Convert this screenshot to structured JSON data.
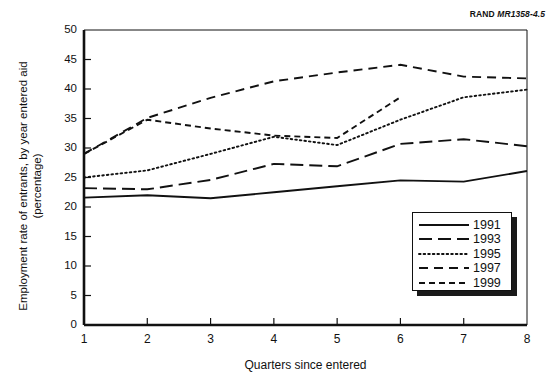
{
  "figure": {
    "source_note_brand": "RAND",
    "source_note_code": "MR1358-4.5"
  },
  "chart_data": {
    "type": "line",
    "title": "",
    "xlabel": "Quarters since entered",
    "ylabel": "Employment rate of entrants, by year entered aid\n(percentage)",
    "x": [
      1,
      2,
      3,
      4,
      5,
      6,
      7,
      8
    ],
    "categories": [
      "1",
      "2",
      "3",
      "4",
      "5",
      "6",
      "7",
      "8"
    ],
    "xlim": [
      1,
      8
    ],
    "ylim": [
      0,
      50
    ],
    "yticks": [
      0,
      5,
      10,
      15,
      20,
      25,
      30,
      35,
      40,
      45,
      50
    ],
    "xticks": [
      "1",
      "2",
      "3",
      "4",
      "5",
      "6",
      "7",
      "8"
    ],
    "grid": false,
    "legend_position": "lower right",
    "series": [
      {
        "name": "1991",
        "style": "solid",
        "x": [
          1,
          2,
          3,
          4,
          5,
          6,
          7,
          8
        ],
        "values": [
          21.6,
          22.0,
          21.5,
          22.5,
          23.5,
          24.5,
          24.3,
          26.1
        ]
      },
      {
        "name": "1993",
        "style": "long-dash",
        "x": [
          1,
          2,
          3,
          4,
          5,
          6,
          7,
          8
        ],
        "values": [
          23.2,
          23.0,
          24.6,
          27.3,
          26.9,
          30.7,
          31.5,
          30.3
        ]
      },
      {
        "name": "1995",
        "style": "dotted",
        "x": [
          1,
          2,
          3,
          4,
          5,
          6,
          7,
          8
        ],
        "values": [
          25.0,
          26.2,
          29.0,
          31.9,
          30.5,
          34.8,
          38.6,
          39.9
        ]
      },
      {
        "name": "1997",
        "style": "dash-dash",
        "x": [
          1,
          2,
          3,
          4,
          5,
          6,
          7,
          8
        ],
        "values": [
          29.0,
          35.1,
          38.5,
          41.3,
          42.8,
          44.1,
          42.1,
          41.8
        ]
      },
      {
        "name": "1999",
        "style": "short-dash",
        "x": [
          1,
          2,
          3,
          4,
          5,
          6
        ],
        "values": [
          29.0,
          34.8,
          33.3,
          32.1,
          31.7,
          38.6
        ]
      }
    ]
  },
  "legend": {
    "items": [
      {
        "label": "1991"
      },
      {
        "label": "1993"
      },
      {
        "label": "1995"
      },
      {
        "label": "1997"
      },
      {
        "label": "1999"
      }
    ]
  }
}
